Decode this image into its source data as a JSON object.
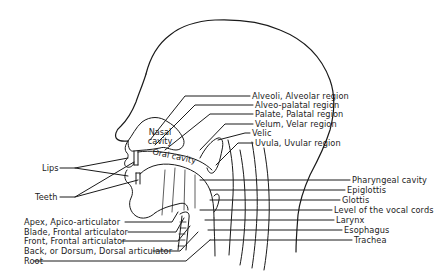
{
  "diagram": {
    "colors": {
      "line": "#1a1a1a",
      "text": "#1c1c1c",
      "background": "#ffffff"
    },
    "inner_labels": {
      "nasal_cavity": [
        "Nasal",
        "cavity"
      ],
      "oral_cavity": "Oral cavity"
    },
    "right_labels": [
      "Alveoli, Alveolar region",
      "Alveo-palatal region",
      "Palate, Palatal region",
      "Velum, Velar region",
      "Velic",
      "Uvula, Uvular region",
      "Pharyngeal cavity",
      "Epiglottis",
      "Glottis",
      "Level of the vocal cords",
      "Larynx",
      "Esophagus",
      "Trachea"
    ],
    "left_labels": [
      "Lips",
      "Teeth",
      "Apex, Apico-articulator",
      "Blade, Frontal articulator",
      "Front, Frontal articulator",
      "Back, or Dorsum, Dorsal articulator",
      "Root"
    ]
  }
}
